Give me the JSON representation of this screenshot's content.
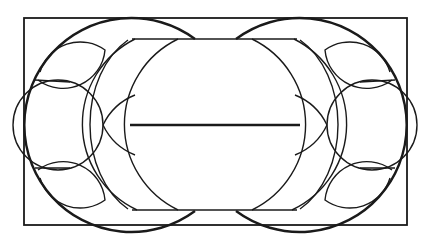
{
  "figure": {
    "type": "geometric line drawing",
    "colors": {
      "stroke": "#1a1a1a",
      "background": "#ffffff"
    },
    "frame": {
      "x": 24,
      "y": 18,
      "width": 383,
      "height": 207
    },
    "central_line_y": 125
  }
}
